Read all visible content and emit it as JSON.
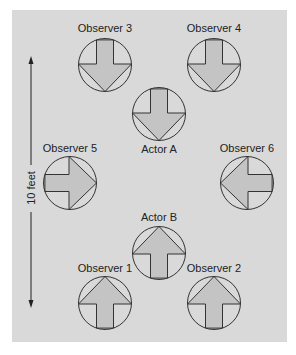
{
  "diagram": {
    "colors": {
      "background": "#ffffff",
      "panel": "#d9d9d9",
      "arrow_fill": "#c4c4c4",
      "stroke": "#333333"
    },
    "scale_label": "10 feet",
    "figures": [
      {
        "id": "observer-3",
        "label": "Observer 3",
        "cx": 105,
        "cy": 65,
        "dir": "down"
      },
      {
        "id": "observer-4",
        "label": "Observer 4",
        "cx": 214,
        "cy": 65,
        "dir": "down"
      },
      {
        "id": "actor-a",
        "label": "Actor A",
        "cx": 159,
        "cy": 114,
        "dir": "down"
      },
      {
        "id": "observer-5",
        "label": "Observer 5",
        "cx": 70,
        "cy": 183,
        "dir": "right"
      },
      {
        "id": "observer-6",
        "label": "Observer 6",
        "cx": 247,
        "cy": 183,
        "dir": "left"
      },
      {
        "id": "actor-b",
        "label": "Actor B",
        "cx": 159,
        "cy": 253,
        "dir": "up"
      },
      {
        "id": "observer-1",
        "label": "Observer 1",
        "cx": 105,
        "cy": 303,
        "dir": "up"
      },
      {
        "id": "observer-2",
        "label": "Observer 2",
        "cx": 214,
        "cy": 303,
        "dir": "up"
      }
    ]
  }
}
